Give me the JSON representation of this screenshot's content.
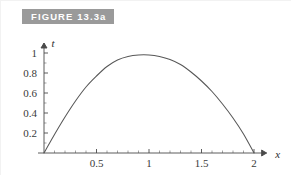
{
  "figure": {
    "label": "FIGURE 13.3a",
    "label_bg": "#9a9a9a",
    "label_color": "#ffffff"
  },
  "chart_data": {
    "type": "line",
    "title": "",
    "subtitle": "",
    "xlabel": "x",
    "ylabel": "t",
    "xlim": [
      0,
      2.12
    ],
    "ylim": [
      0,
      1.1
    ],
    "xticks": [
      0.5,
      1,
      1.5,
      2
    ],
    "xticklabels": [
      "0.5",
      "1",
      "1.5",
      "2"
    ],
    "yticks": [
      0.2,
      0.4,
      0.6,
      0.8,
      1
    ],
    "yticklabels": [
      "0.2",
      "0.4",
      "0.6",
      "0.8",
      "1"
    ],
    "x_minor_step": 0.1,
    "y_minor_step": 0.1,
    "grid": false,
    "legend": null,
    "curve_color": "#575757",
    "axis_color": "#4a4a4a",
    "series": [
      {
        "name": "t(x)",
        "x": [
          0.0,
          0.1,
          0.2,
          0.3,
          0.4,
          0.5,
          0.6,
          0.7,
          0.8,
          0.9,
          1.0,
          1.1,
          1.2,
          1.3,
          1.4,
          1.5,
          1.6,
          1.7,
          1.8,
          1.9,
          2.0
        ],
        "y": [
          0.0,
          0.185,
          0.36,
          0.52,
          0.66,
          0.77,
          0.865,
          0.93,
          0.965,
          0.98,
          0.98,
          0.965,
          0.935,
          0.885,
          0.81,
          0.72,
          0.615,
          0.49,
          0.35,
          0.19,
          0.0
        ]
      }
    ]
  }
}
